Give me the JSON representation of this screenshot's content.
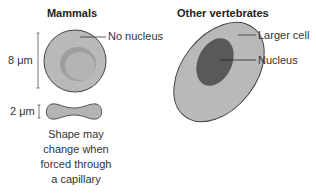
{
  "panels": {
    "mammals": {
      "title": "Mammals",
      "label_no_nucleus": "No nucleus",
      "scale_diameter": "8 μm",
      "scale_thickness": "2 μm",
      "caption": [
        "Shape may",
        "change when",
        "forced through",
        "a capillary"
      ]
    },
    "other_vertebrates": {
      "title": "Other vertebrates",
      "label_larger_cell": "Larger cell",
      "label_nucleus": "Nucleus"
    }
  },
  "colors": {
    "cell_fill": "#b9b9b9",
    "cell_center": "#a9a9a9",
    "nucleus_fill": "#595959",
    "outline": "#444444"
  }
}
